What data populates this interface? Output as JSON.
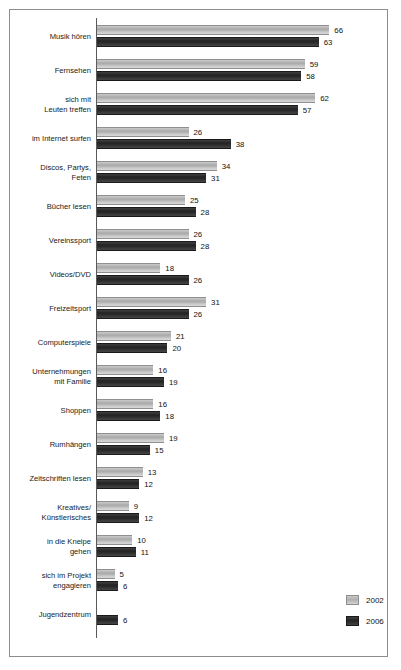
{
  "chart_data": {
    "type": "bar",
    "orientation": "horizontal",
    "title": "",
    "subtitle": "",
    "xlabel": "",
    "ylabel": "",
    "xlim": [
      0,
      70
    ],
    "grid": false,
    "legend_position": "bottom-right",
    "categories": [
      "Musik hören",
      "Fernsehen",
      "sich mit\nLeuten treffen",
      "im Internet surfen",
      "Discos, Partys,\nFeten",
      "Bücher lesen",
      "Vereinssport",
      "Videos/DVD",
      "Freizeitsport",
      "Computerspiele",
      "Unternehmungen\nmit Familie",
      "Shoppen",
      "Rumhängen",
      "Zeitschriften lesen",
      "Kreatives/\nKünstlerisches",
      "in die Kneipe\ngehen",
      "sich im Projekt\nengagieren",
      "Jugendzentrum"
    ],
    "series": [
      {
        "name": "2002",
        "color": "#b5b5b5",
        "values": [
          66,
          59,
          62,
          26,
          34,
          25,
          26,
          18,
          31,
          21,
          16,
          16,
          19,
          13,
          9,
          10,
          5,
          null
        ]
      },
      {
        "name": "2006",
        "color": "#2b2b2b",
        "values": [
          63,
          58,
          57,
          38,
          31,
          28,
          28,
          26,
          26,
          20,
          19,
          18,
          15,
          12,
          12,
          11,
          6,
          6
        ]
      }
    ]
  },
  "legend": {
    "items": [
      {
        "label": "2002",
        "swatch": "light-gray-swatch"
      },
      {
        "label": "2006",
        "swatch": "dark-swatch"
      }
    ]
  }
}
